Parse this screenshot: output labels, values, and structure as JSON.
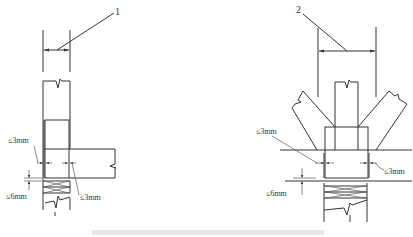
{
  "figure": {
    "left_detail": {
      "callout_label": "1",
      "gap_top_left": "≤3mm",
      "gap_bottom_right": "≤3mm",
      "gap_vertical": "≤6mm"
    },
    "right_detail": {
      "callout_label": "2",
      "gap_left": "≤3mm",
      "gap_right": "≤3mm",
      "gap_vertical": "≤6mm"
    },
    "caption": ""
  },
  "colors": {
    "line": "#333333",
    "background": "#ffffff"
  }
}
